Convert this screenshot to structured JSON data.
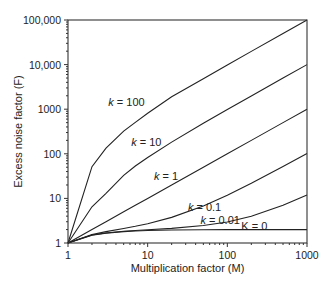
{
  "chart_data": {
    "type": "line",
    "title": "",
    "xlabel": "Multiplication factor (M)",
    "ylabel": "Excess noise factor (F)",
    "xscale": "log",
    "yscale": "log",
    "xlim": [
      1,
      1000
    ],
    "ylim": [
      1,
      100000
    ],
    "grid": false,
    "legend": "inline labels on curves",
    "x_ticks": [
      {
        "value": 1,
        "label": "1"
      },
      {
        "value": 10,
        "label": "10"
      },
      {
        "value": 100,
        "label": "100"
      },
      {
        "value": 1000,
        "label": "1000"
      }
    ],
    "y_ticks": [
      {
        "value": 1,
        "label": "1"
      },
      {
        "value": 10,
        "label": "10"
      },
      {
        "value": 100,
        "label": "100"
      },
      {
        "value": 1000,
        "label": "1000"
      },
      {
        "value": 10000,
        "label": "10,000"
      },
      {
        "value": 100000,
        "label": "100,000"
      }
    ],
    "x": [
      1,
      2,
      3,
      5,
      7,
      10,
      20,
      50,
      100,
      200,
      500,
      1000
    ],
    "series": [
      {
        "name": "k = 100",
        "label_italic_k": true,
        "label_pos": {
          "M": 3.2,
          "F": 1150
        },
        "values": [
          1,
          51.5,
          134,
          321.8,
          506.4,
          811.9,
          1906.5,
          4804,
          9802,
          19801,
          49801,
          99802
        ]
      },
      {
        "name": "k = 10",
        "label_italic_k": true,
        "label_pos": {
          "M": 6.2,
          "F": 150
        },
        "values": [
          1,
          6.5,
          13.0,
          32.8,
          53.1,
          82.9,
          182.5,
          482.2,
          982.1,
          1982,
          4982,
          9982
        ]
      },
      {
        "name": "k = 1",
        "label_italic_k": true,
        "label_pos": {
          "M": 12,
          "F": 26
        },
        "values": [
          1,
          2,
          3,
          5,
          7,
          10,
          20,
          50,
          100,
          200,
          500,
          1000
        ]
      },
      {
        "name": "k = 0.1",
        "label_italic_k": true,
        "label_pos": {
          "M": 32,
          "F": 5.1
        },
        "values": [
          1,
          1.55,
          1.8,
          2.12,
          2.37,
          2.71,
          3.76,
          6.78,
          11.79,
          21.8,
          51.8,
          101.8
        ]
      },
      {
        "name": "k = 0.01",
        "label_italic_k": true,
        "label_pos": {
          "M": 46,
          "F": 2.6
        },
        "values": [
          1,
          1.505,
          1.68,
          1.832,
          1.908,
          1.981,
          2.13,
          2.46,
          2.97,
          3.98,
          6.98,
          11.98
        ]
      },
      {
        "name": "K = 0",
        "label_italic_k": false,
        "label_pos": {
          "M": 150,
          "F": 1.95
        },
        "values": [
          1,
          1.5,
          1.667,
          1.8,
          1.857,
          1.9,
          1.95,
          1.98,
          1.99,
          1.995,
          1.998,
          1.999
        ]
      }
    ]
  },
  "layout": {
    "plot_left": 68,
    "plot_right": 307,
    "plot_top": 20,
    "plot_bottom": 243
  }
}
